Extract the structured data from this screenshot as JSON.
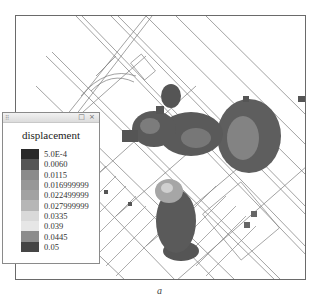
{
  "map": {
    "frame": {
      "x": 15,
      "y": 15,
      "width": 291,
      "height": 265
    },
    "description": "Street network with displacement heat overlay"
  },
  "legend": {
    "title": "displacement",
    "titlebar_buttons": "□ ×",
    "grip": "⠿",
    "items": [
      {
        "label": "5.0E-4",
        "color": "#2a2a2a"
      },
      {
        "label": "0.0060",
        "color": "#555555"
      },
      {
        "label": "0.0115",
        "color": "#8a8a8a"
      },
      {
        "label": "0.016999999",
        "color": "#979797"
      },
      {
        "label": "0.022499999",
        "color": "#a2a2a2"
      },
      {
        "label": "0.027999999",
        "color": "#b6b6b6"
      },
      {
        "label": "0.0335",
        "color": "#d9d9d9"
      },
      {
        "label": "0.039",
        "color": "#e6e6e6"
      },
      {
        "label": "0.0445",
        "color": "#8c8c8c"
      },
      {
        "label": "0.05",
        "color": "#454545"
      }
    ]
  },
  "caption": "a"
}
